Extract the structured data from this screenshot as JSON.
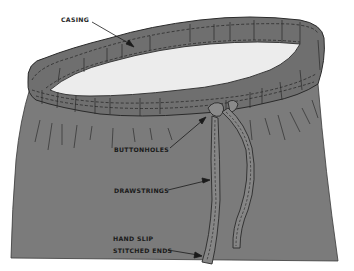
{
  "diagram": {
    "colors": {
      "fabric": "#7d7d7d",
      "fabric_shadow": "#6e6e6e",
      "inside": "#ececec",
      "stitch": "#222222",
      "outline": "#2b2b2b",
      "background": "#ffffff"
    },
    "labels": [
      {
        "id": "casing",
        "text": "CASING"
      },
      {
        "id": "buttonholes",
        "text": "BUTTONHOLES"
      },
      {
        "id": "drawstrings",
        "text": "DRAWSTRINGS"
      },
      {
        "id": "hand_slip",
        "text": "HAND SLIP"
      },
      {
        "id": "stitched_ends",
        "text": "STITCHED ENDS"
      }
    ]
  }
}
